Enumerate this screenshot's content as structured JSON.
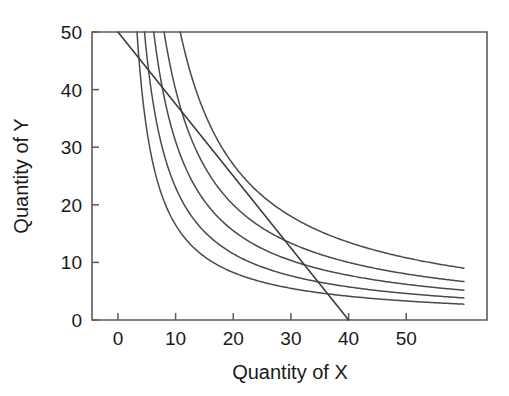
{
  "chart_data": {
    "type": "line",
    "title": "",
    "xlabel": "Quantity of X",
    "ylabel": "Quantity of Y",
    "xlim": [
      -4.5,
      64
    ],
    "ylim": [
      0,
      50
    ],
    "xticks": [
      0,
      10,
      20,
      30,
      40,
      50
    ],
    "yticks": [
      0,
      10,
      20,
      30,
      40,
      50
    ],
    "xtick_labels": [
      "0",
      "10",
      "20",
      "30",
      "40",
      "50"
    ],
    "ytick_labels": [
      "0",
      "10",
      "20",
      "30",
      "40",
      "50"
    ],
    "grid": false,
    "legend": "none",
    "series": [
      {
        "name": "indifference-curve-1",
        "kind": "hyperbola",
        "k": 165,
        "x_start": 3.3,
        "x_end": 60,
        "points": [
          [
            3.3,
            50
          ],
          [
            4,
            41.3
          ],
          [
            5,
            33
          ],
          [
            6,
            27.5
          ],
          [
            8,
            20.6
          ],
          [
            10,
            16.5
          ],
          [
            14,
            11.8
          ],
          [
            20,
            8.3
          ],
          [
            26,
            6.3
          ],
          [
            34,
            4.9
          ],
          [
            42,
            3.9
          ],
          [
            50,
            3.3
          ],
          [
            60,
            2.8
          ]
        ]
      },
      {
        "name": "indifference-curve-2",
        "kind": "hyperbola",
        "k": 230,
        "x_start": 4.6,
        "x_end": 60,
        "points": [
          [
            4.6,
            50
          ],
          [
            6,
            38.3
          ],
          [
            8,
            28.8
          ],
          [
            10,
            23
          ],
          [
            14,
            16.4
          ],
          [
            20,
            11.5
          ],
          [
            26,
            8.8
          ],
          [
            34,
            6.8
          ],
          [
            42,
            5.5
          ],
          [
            50,
            4.6
          ],
          [
            60,
            3.8
          ]
        ]
      },
      {
        "name": "indifference-curve-3",
        "kind": "hyperbola",
        "k": 310,
        "x_start": 6.2,
        "x_end": 60,
        "points": [
          [
            6.2,
            50
          ],
          [
            8,
            38.8
          ],
          [
            10,
            31
          ],
          [
            14,
            22.1
          ],
          [
            20,
            15.5
          ],
          [
            26,
            11.9
          ],
          [
            34,
            9.1
          ],
          [
            42,
            7.4
          ],
          [
            50,
            6.2
          ],
          [
            60,
            5.2
          ]
        ]
      },
      {
        "name": "indifference-curve-4",
        "kind": "hyperbola",
        "k": 400,
        "x_start": 8,
        "x_end": 60,
        "points": [
          [
            8,
            50
          ],
          [
            10,
            40
          ],
          [
            14,
            28.6
          ],
          [
            20,
            20
          ],
          [
            26,
            15.4
          ],
          [
            34,
            11.8
          ],
          [
            42,
            9.5
          ],
          [
            50,
            8
          ],
          [
            60,
            6.7
          ]
        ]
      },
      {
        "name": "indifference-curve-5",
        "kind": "hyperbola",
        "k": 540,
        "x_start": 10.8,
        "x_end": 60,
        "points": [
          [
            10.8,
            50
          ],
          [
            14,
            38.6
          ],
          [
            20,
            27
          ],
          [
            26,
            20.8
          ],
          [
            34,
            15.9
          ],
          [
            42,
            12.9
          ],
          [
            50,
            10.8
          ],
          [
            60,
            9
          ]
        ]
      },
      {
        "name": "budget-line",
        "kind": "straight",
        "points": [
          [
            0,
            50
          ],
          [
            40,
            0
          ]
        ],
        "x_intercept": 40,
        "y_intercept": 50,
        "slope": -1.25
      }
    ]
  },
  "axes": {
    "x_axis_title": "Quantity of X",
    "y_axis_title": "Quantity of Y"
  },
  "colors": {
    "curve": "#4a4a4a",
    "budget": "#3d3d3d",
    "frame": "#5b5b5b",
    "text": "#1a1a1a",
    "background": "#ffffff"
  }
}
